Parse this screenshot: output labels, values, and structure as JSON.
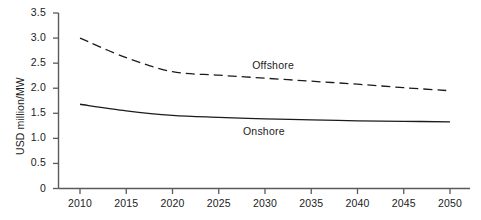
{
  "chart_data": {
    "type": "line",
    "title": "",
    "subtitle": "",
    "xlabel": "",
    "ylabel": "USD million/MW",
    "xlim": [
      2008,
      2052
    ],
    "ylim": [
      0,
      3.5
    ],
    "grid": false,
    "legend_position": "inline-labels",
    "x_ticks": [
      "2010",
      "2015",
      "2020",
      "2025",
      "2030",
      "2035",
      "2040",
      "2045",
      "2050"
    ],
    "y_ticks": [
      "0",
      "0.5",
      "1.0",
      "1.5",
      "2.0",
      "2.5",
      "3.0",
      "3.5"
    ],
    "x": [
      2010,
      2015,
      2020,
      2025,
      2030,
      2035,
      2040,
      2045,
      2050
    ],
    "series": [
      {
        "name": "Offshore",
        "style": "dashed",
        "color": "#1b1b1b",
        "label_x": 2031,
        "label_y": 2.45,
        "values": [
          3.0,
          2.61,
          2.33,
          2.26,
          2.2,
          2.14,
          2.08,
          2.01,
          1.95
        ]
      },
      {
        "name": "Onshore",
        "style": "solid",
        "color": "#1b1b1b",
        "label_x": 2030,
        "label_y": 1.12,
        "values": [
          1.68,
          1.55,
          1.46,
          1.42,
          1.39,
          1.37,
          1.35,
          1.34,
          1.33
        ]
      }
    ]
  },
  "axes": {
    "y_axis_name": "y-axis",
    "x_axis_name": "x-axis"
  }
}
